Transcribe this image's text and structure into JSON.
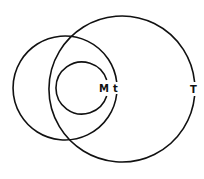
{
  "diagram": {
    "stroke_color": "#111111",
    "background": "#ffffff",
    "circles": [
      {
        "id": "T",
        "label": "T",
        "cx": 122,
        "cy": 89,
        "r": 73
      },
      {
        "id": "t",
        "label": "t",
        "cx": 65,
        "cy": 88,
        "r": 52
      },
      {
        "id": "M",
        "label": "M",
        "cx": 82,
        "cy": 88,
        "r": 26
      }
    ],
    "labels": {
      "M": "M",
      "t": "t",
      "T": "T"
    }
  }
}
